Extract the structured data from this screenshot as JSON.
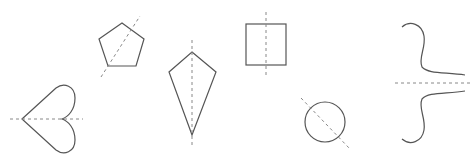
{
  "diagram": {
    "title": "",
    "colors": {
      "shape_stroke": "#555555",
      "axis_stroke": "#888888",
      "background": "#ffffff"
    },
    "shapes": [
      {
        "name": "heart",
        "axis": "horizontal"
      },
      {
        "name": "pentagon",
        "axis": "diagonal"
      },
      {
        "name": "kite",
        "axis": "vertical"
      },
      {
        "name": "rectangle",
        "axis": "vertical"
      },
      {
        "name": "circle",
        "axis": "diagonal"
      },
      {
        "name": "s-curves",
        "axis": "horizontal"
      }
    ]
  }
}
